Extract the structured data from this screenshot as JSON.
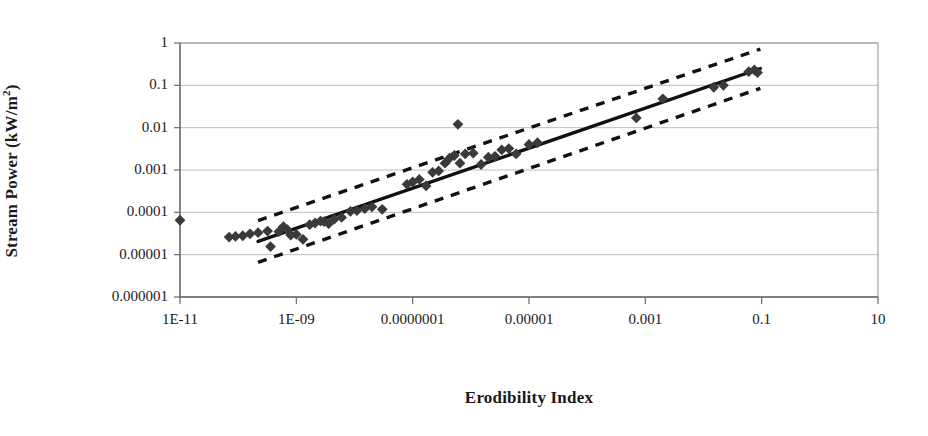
{
  "chart_data": {
    "type": "scatter",
    "title": "",
    "xlabel": "Erodibility Index",
    "ylabel": "Stream Power (kW/m2)",
    "ylabel_base": "Stream Power (kW/m",
    "ylabel_sup": "2",
    "ylabel_tail": ")",
    "xscale": "log",
    "yscale": "log",
    "xlim": [
      1e-11,
      10
    ],
    "ylim": [
      1e-06,
      1
    ],
    "grid": "horizontal",
    "legend": "none",
    "xtick_labels": [
      "1E-11",
      "1E-09",
      "0.0000001",
      "0.00001",
      "0.001",
      "0.1",
      "10"
    ],
    "xtick_values": [
      1e-11,
      1e-09,
      1e-07,
      1e-05,
      0.001,
      0.1,
      10
    ],
    "ytick_labels": [
      "1",
      "0.1",
      "0.01",
      "0.001",
      "0.0001",
      "0.00001",
      "0.000001"
    ],
    "ytick_values": [
      1,
      0.1,
      0.01,
      0.001,
      0.0001,
      1e-05,
      1e-06
    ],
    "series": [
      {
        "name": "Observed data",
        "marker": "diamond",
        "color": "#3a3a3a",
        "points": [
          [
            1e-11,
            6.5e-05
          ],
          [
            7e-11,
            2.6e-05
          ],
          [
            9e-11,
            2.7e-05
          ],
          [
            1.2e-10,
            2.8e-05
          ],
          [
            1.6e-10,
            3.1e-05
          ],
          [
            2.2e-10,
            3.3e-05
          ],
          [
            3.2e-10,
            3.6e-05
          ],
          [
            3.6e-10,
            1.55e-05
          ],
          [
            5e-10,
            3.5e-05
          ],
          [
            6e-10,
            4.6e-05
          ],
          [
            7e-10,
            3.9e-05
          ],
          [
            8e-10,
            2.9e-05
          ],
          [
            1e-09,
            3e-05
          ],
          [
            1.3e-09,
            2.3e-05
          ],
          [
            1.7e-09,
            5.1e-05
          ],
          [
            2.1e-09,
            5.6e-05
          ],
          [
            2.6e-09,
            6.2e-05
          ],
          [
            3e-09,
            6e-05
          ],
          [
            3.6e-09,
            5.4e-05
          ],
          [
            4.5e-09,
            6.9e-05
          ],
          [
            6e-09,
            7.6e-05
          ],
          [
            8.5e-09,
            0.000105
          ],
          [
            1.1e-08,
            0.00011
          ],
          [
            1.5e-08,
            0.000122
          ],
          [
            2e-08,
            0.000135
          ],
          [
            3e-08,
            0.000118
          ],
          [
            8e-08,
            0.00046
          ],
          [
            1e-07,
            0.00052
          ],
          [
            1.3e-07,
            0.0006
          ],
          [
            1.7e-07,
            0.00042
          ],
          [
            2.2e-07,
            0.00088
          ],
          [
            2.8e-07,
            0.00095
          ],
          [
            3.6e-07,
            0.00145
          ],
          [
            4.3e-07,
            0.0019
          ],
          [
            5.2e-07,
            0.0022
          ],
          [
            6e-07,
            0.012
          ],
          [
            6.5e-07,
            0.00145
          ],
          [
            8e-07,
            0.0024
          ],
          [
            1.1e-06,
            0.0025
          ],
          [
            1.5e-06,
            0.00135
          ],
          [
            2e-06,
            0.002
          ],
          [
            2.6e-06,
            0.0021
          ],
          [
            3.4e-06,
            0.003
          ],
          [
            4.5e-06,
            0.0032
          ],
          [
            6e-06,
            0.0024
          ],
          [
            1e-05,
            0.004
          ],
          [
            1.4e-05,
            0.0044
          ],
          [
            0.0007,
            0.017
          ],
          [
            0.002,
            0.048
          ],
          [
            0.015,
            0.09
          ],
          [
            0.022,
            0.1
          ],
          [
            0.06,
            0.21
          ],
          [
            0.075,
            0.23
          ],
          [
            0.085,
            0.2
          ]
        ]
      }
    ],
    "fit_line": {
      "name": "Regression line",
      "style": "solid",
      "color": "#111111",
      "x_start": 2.2e-10,
      "y_start": 2.05e-05,
      "x_end": 0.095,
      "y_end": 0.25
    },
    "confidence_bands": [
      {
        "name": "Upper confidence limit",
        "style": "dashed",
        "color": "#111111",
        "x_start": 2.2e-10,
        "y_start": 6.4e-05,
        "x_end": 0.095,
        "y_end": 0.72
      },
      {
        "name": "Lower confidence limit",
        "style": "dashed",
        "color": "#111111",
        "x_start": 2.2e-10,
        "y_start": 6.6e-06,
        "x_end": 0.095,
        "y_end": 0.085
      }
    ],
    "plot_box": {
      "left": 180,
      "top": 43,
      "right": 878,
      "bottom": 297
    },
    "colors": {
      "marker": "#3a3a3a",
      "line": "#111111",
      "grid": "#b5b5b5",
      "frame": "#9a9a9a",
      "text": "#1a1a1a",
      "background": "#ffffff"
    }
  }
}
